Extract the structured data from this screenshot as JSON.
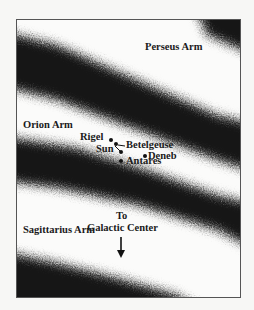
{
  "diagram": {
    "type": "galactic spiral arms map",
    "arms": [
      {
        "name": "Perseus Arm"
      },
      {
        "name": "Orion Arm"
      },
      {
        "name": "Sagittarius Arm"
      }
    ],
    "stars": [
      {
        "name": "Rigel"
      },
      {
        "name": "Sun"
      },
      {
        "name": "Betelgeuse"
      },
      {
        "name": "Deneb"
      },
      {
        "name": "Antares"
      }
    ],
    "direction": {
      "line1": "To",
      "line2": "Galactic Center",
      "icon": "arrow-down-icon"
    },
    "colors": {
      "band": "#151515",
      "background": "#fbfbfa",
      "border": "#555555"
    }
  }
}
